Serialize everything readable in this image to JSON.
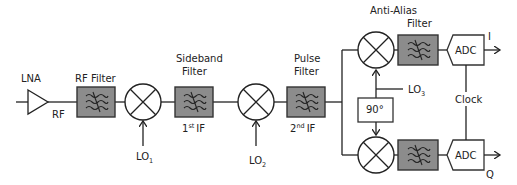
{
  "diagram": {
    "colors": {
      "filter_fill": "#8c8c8c",
      "stroke": "#222222",
      "background": "#ffffff"
    },
    "lna": {
      "label": "LNA",
      "signal": "RF"
    },
    "rf_filter": {
      "label": "RF Filter"
    },
    "mixer1": {
      "lo": "LO",
      "lo_sub": "1"
    },
    "sideband_filter": {
      "label_line1": "Sideband",
      "label_line2": "Filter",
      "signal": "IF",
      "signal_prefix": "1",
      "signal_sup": "st"
    },
    "mixer2": {
      "lo": "LO",
      "lo_sub": "2"
    },
    "pulse_filter": {
      "label_line1": "Pulse",
      "label_line2": "Filter",
      "signal": "IF",
      "signal_prefix": "2",
      "signal_sup": "nd"
    },
    "iq": {
      "lo": "LO",
      "lo_sub": "3",
      "phase_shift": "90°",
      "anti_alias_line1": "Anti-Alias",
      "anti_alias_line2": "Filter",
      "adc_top": "ADC",
      "adc_bottom": "ADC",
      "clock": "Clock",
      "out_i": "I",
      "out_q": "Q"
    }
  }
}
